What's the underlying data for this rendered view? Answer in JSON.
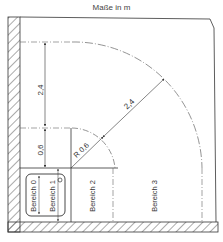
{
  "title": "Maße in m",
  "dimensions": {
    "upper_vertical": "2,4",
    "lower_vertical": "0,6",
    "radius_small": "R 0,6",
    "radius_large": "2,4"
  },
  "zones": [
    {
      "label": "Bereich 0"
    },
    {
      "label": "Bereich 1"
    },
    {
      "label": "Bereich 2"
    },
    {
      "label": "Bereich 3"
    }
  ],
  "colors": {
    "line": "#333333",
    "dashed": "#666666",
    "hatch": "#444444",
    "background": "#ffffff"
  }
}
